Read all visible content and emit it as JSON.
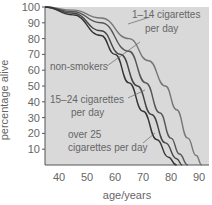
{
  "chart_data": {
    "type": "line",
    "title": "",
    "xlabel": "age/years",
    "ylabel": "percentage alive",
    "xlim": [
      35,
      92
    ],
    "ylim": [
      0,
      100
    ],
    "xticks": [
      40,
      50,
      60,
      70,
      80,
      90
    ],
    "yticks": [
      10,
      20,
      30,
      40,
      50,
      60,
      70,
      80,
      90,
      100
    ],
    "grid": false,
    "series": [
      {
        "name": "1–14 cigarettes per day",
        "x": [
          35,
          45,
          55,
          65,
          72,
          78,
          82,
          86,
          89,
          91
        ],
        "y": [
          100,
          98,
          93,
          80,
          66,
          50,
          35,
          17,
          6,
          0
        ]
      },
      {
        "name": "non-smokers",
        "x": [
          35,
          45,
          55,
          65,
          71,
          76,
          80,
          83,
          86
        ],
        "y": [
          100,
          97,
          90,
          72,
          52,
          33,
          17,
          7,
          0
        ]
      },
      {
        "name": "15–24 cigarettes per day",
        "x": [
          35,
          45,
          55,
          62,
          68,
          73,
          78,
          82,
          84
        ],
        "y": [
          100,
          96,
          85,
          70,
          50,
          32,
          14,
          4,
          0
        ]
      },
      {
        "name": "over 25 cigarettes per day",
        "x": [
          35,
          45,
          55,
          60,
          65,
          70,
          75,
          79,
          82
        ],
        "y": [
          100,
          95,
          82,
          70,
          52,
          34,
          16,
          5,
          0
        ]
      }
    ],
    "annotations": [
      "1–14 cigarettes per day",
      "non-smokers",
      "15–24 cigarettes per day",
      "over 25 cigarettes per day"
    ]
  },
  "labels": {
    "ylabel": "percentage alive",
    "xlabel": "age/years",
    "a1l1": "1–14 cigarettes",
    "a1l2": "per day",
    "a2": "non-smokers",
    "a3l1": "15–24 cigarettes",
    "a3l2": "per day",
    "a4l1": "over 25",
    "a4l2": "cigarettes per day",
    "y": [
      "100",
      "90",
      "80",
      "70",
      "60",
      "50",
      "40",
      "30",
      "20",
      "10"
    ],
    "x": [
      "40",
      "50",
      "60",
      "70",
      "80",
      "90"
    ]
  }
}
